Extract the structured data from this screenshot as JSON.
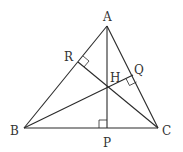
{
  "diagram": {
    "type": "triangle-orthocenter",
    "colors": {
      "stroke": "#2a2a2a",
      "label": "#333333",
      "background": "#ffffff"
    },
    "points": {
      "A": {
        "x": 107,
        "y": 26,
        "label": "A"
      },
      "B": {
        "x": 24,
        "y": 128,
        "label": "B"
      },
      "C": {
        "x": 158,
        "y": 128,
        "label": "C"
      },
      "P": {
        "x": 107,
        "y": 128,
        "label": "P"
      },
      "Q": {
        "x": 133,
        "y": 75,
        "label": "Q"
      },
      "R": {
        "x": 78,
        "y": 62,
        "label": "R"
      },
      "H": {
        "x": 107,
        "y": 88,
        "label": "H"
      }
    },
    "labels": {
      "A": "A",
      "B": "B",
      "C": "C",
      "P": "P",
      "Q": "Q",
      "R": "R",
      "H": "H"
    },
    "segments": [
      "AB",
      "BC",
      "CA",
      "AP",
      "BQ",
      "CR"
    ],
    "right_angles": [
      "P",
      "Q",
      "R"
    ]
  }
}
